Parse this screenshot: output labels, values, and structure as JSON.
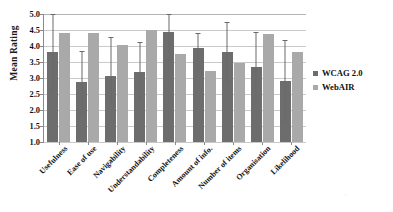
{
  "chart_data": {
    "type": "bar",
    "title": "",
    "xlabel": "",
    "ylabel": "Mean Rating",
    "ylim": [
      1.0,
      5.0
    ],
    "ytick_step": 0.5,
    "yticks": [
      "5.0",
      "4.5",
      "4.0",
      "3.5",
      "3.0",
      "2.5",
      "2.0",
      "1.5",
      "1.0"
    ],
    "ytick_values": [
      5.0,
      4.5,
      4.0,
      3.5,
      3.0,
      2.5,
      2.0,
      1.5,
      1.0
    ],
    "grid": true,
    "grid_axis": "y",
    "legend_position": "right",
    "error_bars": true,
    "categories": [
      "Usefulness",
      "Ease of use",
      "Navigability",
      "Understandability",
      "Completeness",
      "Amount of info.",
      "Number of items",
      "Organisation",
      "Likelihood"
    ],
    "series": [
      {
        "name": "WCAG 2.0",
        "color": "#6d6d6d",
        "values": [
          3.8,
          2.87,
          3.07,
          3.2,
          4.43,
          3.95,
          3.82,
          3.33,
          2.9
        ],
        "error_low": [
          2.6,
          1.9,
          2.3,
          2.33,
          3.57,
          3.3,
          2.83,
          2.23,
          1.63
        ],
        "error_high": [
          5.0,
          3.85,
          4.28,
          4.12,
          5.0,
          4.42,
          4.75,
          4.45,
          4.2
        ]
      },
      {
        "name": "WebAIR",
        "color": "#a9a9a9",
        "values": [
          4.4,
          4.42,
          4.02,
          4.5,
          3.75,
          3.22,
          3.47,
          4.38,
          3.8
        ]
      }
    ]
  },
  "legend": {
    "items": [
      {
        "label": "WCAG 2.0",
        "swatch": "legend-swatch-dark"
      },
      {
        "label": "WebAIR",
        "swatch": "legend-swatch-light"
      }
    ]
  },
  "axis": {
    "y_title": "Mean Rating"
  }
}
